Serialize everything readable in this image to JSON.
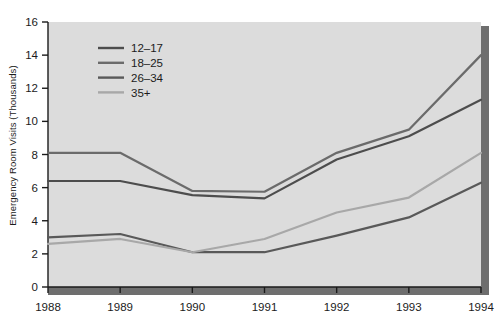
{
  "chart_data": {
    "type": "line",
    "title": "",
    "subtitle": "",
    "xlabel": "",
    "ylabel": "Emergency Room Visits (Thousands)",
    "x": [
      1988,
      1989,
      1990,
      1991,
      1992,
      1993,
      1994
    ],
    "xticklabels": [
      "1988",
      "1989",
      "1990",
      "1991",
      "1992",
      "1993",
      "1994"
    ],
    "yticklabels": [
      "0",
      "2",
      "4",
      "6",
      "8",
      "10",
      "12",
      "14",
      "16"
    ],
    "yticks": [
      0,
      2,
      4,
      6,
      8,
      10,
      12,
      14,
      16
    ],
    "ylim": [
      0,
      16
    ],
    "xlim": [
      1988,
      1994
    ],
    "grid": false,
    "legend_position": "upper-left-inside",
    "plot_background": "#dcdcdc",
    "series": [
      {
        "name": "12-17",
        "color": "#4d4d4d",
        "values": [
          6.4,
          6.4,
          5.55,
          5.35,
          7.7,
          9.1,
          11.3
        ]
      },
      {
        "name": "18-25",
        "color": "#6b6b6b",
        "values": [
          8.1,
          8.1,
          5.8,
          5.75,
          8.1,
          9.5,
          14.0
        ]
      },
      {
        "name": "26-34",
        "color": "#595959",
        "values": [
          3.0,
          3.2,
          2.1,
          2.1,
          3.1,
          4.2,
          6.3
        ]
      },
      {
        "name": "35+",
        "color": "#a8a8a8",
        "values": [
          2.6,
          2.9,
          2.1,
          2.9,
          4.5,
          5.4,
          8.1
        ]
      }
    ]
  },
  "legend": {
    "entries": [
      {
        "label": "12-17"
      },
      {
        "label": "18-25"
      },
      {
        "label": "26-34"
      },
      {
        "label": "35+"
      }
    ]
  },
  "axes": {
    "y_title": "Emergency Room Visits (Thousands)"
  },
  "colors": {
    "plot_bg": "#dcdcdc",
    "page_bg": "#ffffff",
    "axis": "#1b1b1b",
    "shadow": "#6e6e6e",
    "text": "#1b1b1b"
  }
}
